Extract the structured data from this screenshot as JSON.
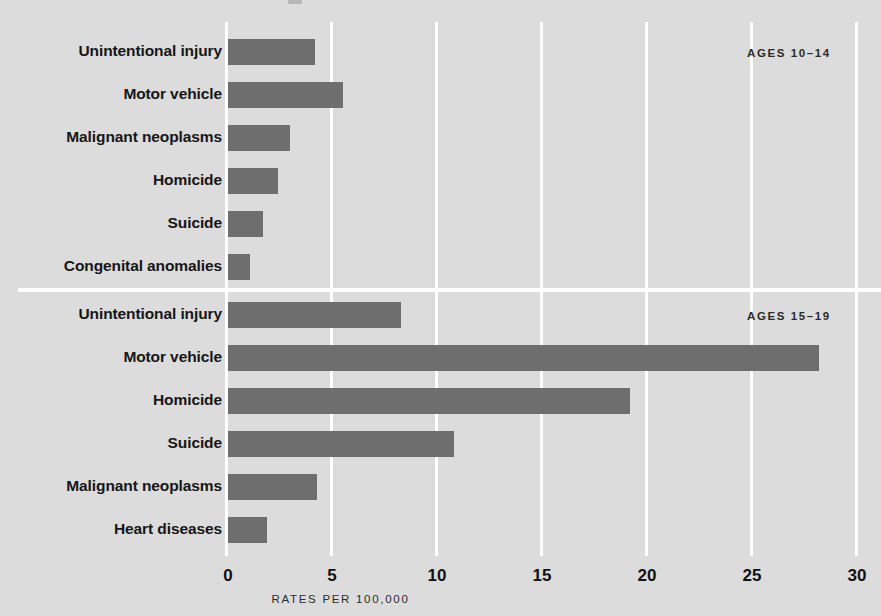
{
  "chart_data": {
    "type": "bar",
    "orientation": "horizontal",
    "title": "",
    "xlabel": "RATES PER 100,000",
    "ylabel": "",
    "xlim": [
      0,
      30
    ],
    "xticks": [
      "0",
      "5",
      "10",
      "15",
      "20",
      "25",
      "30"
    ],
    "xtick_values": [
      0,
      5,
      10,
      15,
      20,
      25,
      30
    ],
    "grid": "vertical white gridlines at every tick",
    "legend": "none",
    "bar_color": "#6e6e6e",
    "background_color": "#dcdcdc",
    "panels": [
      {
        "annotation": "AGES 10–14",
        "categories": [
          "Unintentional injury",
          "Motor vehicle",
          "Malignant neoplasms",
          "Homicide",
          "Suicide",
          "Congenital anomalies"
        ],
        "values": [
          4.3,
          5.6,
          3.1,
          2.5,
          1.8,
          1.2
        ]
      },
      {
        "annotation": "AGES 15–19",
        "categories": [
          "Unintentional injury",
          "Motor vehicle",
          "Homicide",
          "Suicide",
          "Malignant neoplasms",
          "Heart diseases"
        ],
        "values": [
          8.4,
          28.3,
          19.3,
          10.9,
          4.4,
          2.0
        ]
      }
    ]
  }
}
